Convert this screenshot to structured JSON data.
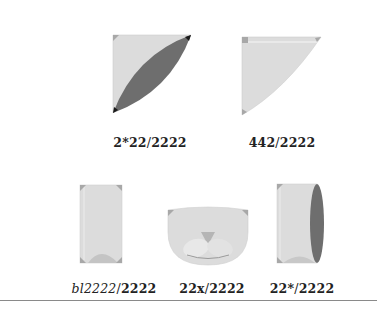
{
  "colors": {
    "fill": "#dcdcdc",
    "fill_light": "#e4e4e4",
    "corner": "#a8a8a8",
    "dark": "#6e6e6e",
    "black": "#1a1a1a",
    "rule": "#8a8a8a"
  },
  "shapes": [
    {
      "id": "shape-1",
      "label_prefix": "2*22",
      "label_slash": "/",
      "label_suffix": "2222",
      "prefix_style": "bold"
    },
    {
      "id": "shape-2",
      "label_prefix": "442",
      "label_slash": "/",
      "label_suffix": "2222",
      "prefix_style": "bold"
    },
    {
      "id": "shape-3",
      "label_prefix": "bl2222",
      "label_slash": "/",
      "label_suffix": "2222",
      "prefix_style": "italic"
    },
    {
      "id": "shape-4",
      "label_prefix": "22x",
      "label_slash": "/",
      "label_suffix": "2222",
      "prefix_style": "bold"
    },
    {
      "id": "shape-5",
      "label_prefix": "22*",
      "label_slash": "/",
      "label_suffix": "2222",
      "prefix_style": "bold"
    }
  ]
}
